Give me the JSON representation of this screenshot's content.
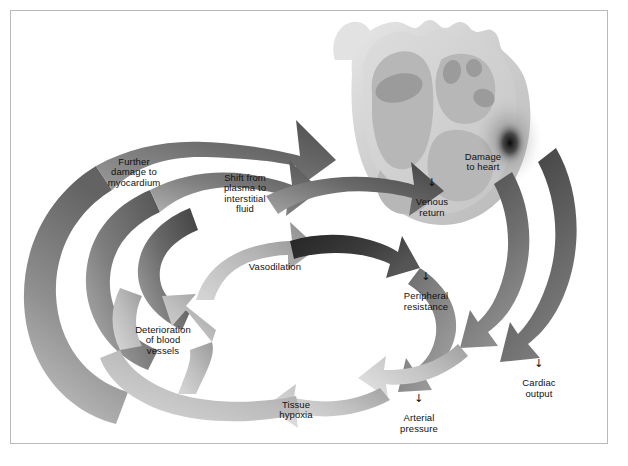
{
  "figure": {
    "kind": "medical-cycle-diagram",
    "background_color": "#ffffff",
    "border_color": "#b9b9b9",
    "text_color": "#111111",
    "decrease_marker": "↓"
  },
  "heart": {
    "name": "heart-illustration",
    "outer_color": "#cdcdcd",
    "wall_color": "#d9d9d9",
    "chamber_color": "#b4b4b4",
    "cavity_color": "#9a9a9a",
    "damage_color": "#141414",
    "damage_label": "Damage\nto heart"
  },
  "labels": [
    {
      "id": "damage-to-heart",
      "text": "Damage\nto heart",
      "marker": "",
      "x": 452,
      "y": 141,
      "w": 62
    },
    {
      "id": "venous-return",
      "text": "Venous\nreturn",
      "marker": "↓",
      "x": 404,
      "y": 175,
      "w": 56
    },
    {
      "id": "cardiac-output",
      "text": "Cardiac\noutput",
      "marker": "↓",
      "x": 511,
      "y": 356,
      "w": 56
    },
    {
      "id": "arterial-pressure",
      "text": "Arterial\npressure",
      "marker": "↓",
      "x": 388,
      "y": 391,
      "w": 62
    },
    {
      "id": "tissue-hypoxia",
      "text": "Tissue\nhypoxia",
      "marker": "",
      "x": 267,
      "y": 389,
      "w": 58
    },
    {
      "id": "deterioration",
      "text": "Deterioration\nof blood\nvessels",
      "marker": "",
      "x": 125,
      "y": 314,
      "w": 76
    },
    {
      "id": "vasodilation",
      "text": "Vasodilation",
      "marker": "",
      "x": 242,
      "y": 251,
      "w": 66
    },
    {
      "id": "peripheral-resist",
      "text": "Peripheral\nresistance",
      "marker": "↓",
      "x": 394,
      "y": 269,
      "w": 64
    },
    {
      "id": "shift-from-plasma",
      "text": "Shift from\nplasma to\ninterstitial\nfluid",
      "marker": "",
      "x": 212,
      "y": 162,
      "w": 66
    },
    {
      "id": "further-damage",
      "text": "Further\ndamage to\nmyocardium",
      "marker": "",
      "x": 95,
      "y": 146,
      "w": 78
    }
  ],
  "arrows": [
    {
      "id": "arrow-further-damage-outer",
      "from": "Further damage to myocardium",
      "to": "Damage to heart",
      "tone_start": "#707070",
      "tone_end": "#4f4f4f"
    },
    {
      "id": "arrow-shift-plasma",
      "from": "Shift from plasma to interstitial fluid",
      "to": "Further damage to myocardium",
      "tone_start": "#8a8a8a",
      "tone_end": "#5b5b5b"
    },
    {
      "id": "arrow-venous-return",
      "from": "Venous return",
      "to": "Shift from plasma to interstitial fluid",
      "tone_start": "#6b6b6b",
      "tone_end": "#4a4a4a"
    },
    {
      "id": "arrow-peripheral-resist",
      "from": "Peripheral resistance",
      "to": "Venous return",
      "tone_start": "#2e2e2e",
      "tone_end": "#4a4a4a"
    },
    {
      "id": "arrow-vasodilation",
      "from": "Vasodilation",
      "to": "Peripheral resistance",
      "tone_start": "#8d8d8d",
      "tone_end": "#585858"
    },
    {
      "id": "arrow-deterioration",
      "from": "Deterioration of blood vessels",
      "to": "Vasodilation",
      "tone_start": "#a9a9a9",
      "tone_end": "#787878"
    },
    {
      "id": "arrow-tissue-hypoxia",
      "from": "Tissue hypoxia",
      "to": "Deterioration of blood vessels",
      "tone_start": "#c6c6c6",
      "tone_end": "#9e9e9e"
    },
    {
      "id": "arrow-arterial-pressure",
      "from": "Arterial pressure",
      "to": "Tissue hypoxia",
      "tone_start": "#b2b2b2",
      "tone_end": "#cfcfcf"
    },
    {
      "id": "arrow-cardiac-output",
      "from": "Cardiac output",
      "to": "Arterial pressure",
      "tone_start": "#8f8f8f",
      "tone_end": "#a8a8a8"
    },
    {
      "id": "arrow-damage-to-heart",
      "from": "Damage to heart",
      "to": "Cardiac output",
      "tone_start": "#3d3d3d",
      "tone_end": "#6f6f6f"
    }
  ]
}
